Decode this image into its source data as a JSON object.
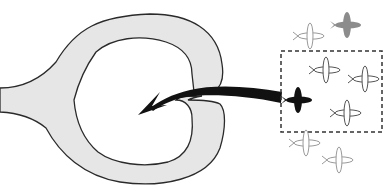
{
  "diagram": {
    "colors": {
      "background": "#ffffff",
      "vessel_fill": "#e6e6e6",
      "vessel_stroke": "#2a2a2a",
      "arrow": "#111111",
      "selected_plane": "#111111",
      "gray_plane": "#8c8c8c",
      "outline_plane_stroke": "#555555",
      "faded_plane_stroke": "#9a9a9a",
      "dashed_box": "#333333"
    },
    "icons": {
      "vessel": "heart-vessel-shape",
      "arrow": "curved-arrow-left",
      "plane": "plane-icon"
    },
    "selection_box": {
      "x": 281,
      "y": 51,
      "width": 101,
      "height": 81,
      "style": "dashed"
    },
    "planes": [
      {
        "id": "top-left-outline",
        "x": 311,
        "y": 36,
        "style": "faded-outline"
      },
      {
        "id": "top-right-gray",
        "x": 347,
        "y": 25,
        "style": "gray-filled"
      },
      {
        "id": "inside-top",
        "x": 327,
        "y": 70,
        "style": "outline"
      },
      {
        "id": "inside-right",
        "x": 366,
        "y": 79,
        "style": "outline"
      },
      {
        "id": "selected-black",
        "x": 299,
        "y": 100,
        "style": "black-filled"
      },
      {
        "id": "inside-bottom",
        "x": 348,
        "y": 113,
        "style": "outline"
      },
      {
        "id": "below-left",
        "x": 307,
        "y": 143,
        "style": "faded-outline"
      },
      {
        "id": "below-right",
        "x": 340,
        "y": 160,
        "style": "faded-outline"
      }
    ],
    "caption": "Selected object moved into the vessel"
  }
}
